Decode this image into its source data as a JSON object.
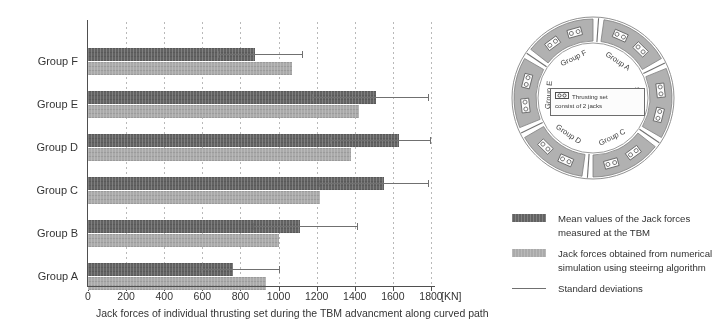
{
  "chart_data": {
    "type": "bar",
    "orientation": "horizontal",
    "title": "",
    "xlabel": "Jack forces of individual thrusting set during the TBM advancment along curved path",
    "xunit": "[KN]",
    "ylabel": "",
    "xlim": [
      0,
      1800
    ],
    "xticks": [
      0,
      200,
      400,
      600,
      800,
      1000,
      1200,
      1400,
      1600,
      1800
    ],
    "grid": true,
    "legend_position": "right",
    "categories": [
      "Group A",
      "Group B",
      "Group C",
      "Group D",
      "Group E",
      "Group F"
    ],
    "series": [
      {
        "name": "Mean values of the Jack forces measured at the TBM",
        "color": "#5e5e5e",
        "values": [
          760,
          1110,
          1555,
          1630,
          1510,
          875
        ],
        "errors_upper": [
          1010,
          1415,
          1790,
          1800,
          1790,
          1130
        ]
      },
      {
        "name": "Jack forces obtained from numerical simulation using steeirng algorithm",
        "color": "#a9a9a9",
        "values": [
          935,
          1000,
          1215,
          1380,
          1420,
          1070
        ]
      }
    ],
    "error_series": {
      "name": "Standard deviations",
      "color": "#6d6d6d"
    }
  },
  "axis": {
    "tick_labels": [
      "0",
      "200",
      "400",
      "600",
      "800",
      "1000",
      "1200",
      "1400",
      "1600",
      "1800"
    ],
    "unit_label": "[KN]",
    "caption": "Jack forces of individual thrusting set during the TBM advancment along curved path"
  },
  "ring_diagram": {
    "segments": [
      {
        "label": "Group A"
      },
      {
        "label": "Group B"
      },
      {
        "label": "Group C"
      },
      {
        "label": "Group D"
      },
      {
        "label": "Group E"
      },
      {
        "label": "Group F"
      }
    ],
    "note_symbol": "[▫▫]",
    "note_line1": "Thrusting set",
    "note_line2": "consist of 2 jacks"
  },
  "legend": {
    "items": [
      {
        "type": "swatch-dark",
        "label": "Mean values of the Jack forces measured at the TBM"
      },
      {
        "type": "swatch-light",
        "label": "Jack forces obtained from numerical simulation using steeirng algorithm"
      },
      {
        "type": "line",
        "label": "Standard deviations"
      }
    ]
  }
}
